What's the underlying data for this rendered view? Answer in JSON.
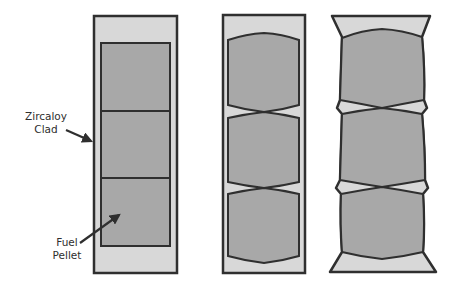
{
  "labels": {
    "clad": {
      "line1": "Zircaloy",
      "line2": "Clad"
    },
    "fuel": {
      "line1": "Fuel",
      "line2": "Pellet"
    }
  },
  "colors": {
    "background": "#ffffff",
    "clad_gap": "#d8d8d8",
    "pellet": "#a8a8a8",
    "outline": "#2f2f2f"
  },
  "panels": [
    {
      "id": "initial",
      "pellet_count": 3
    },
    {
      "id": "pellet-hourglassing",
      "pellet_count": 3
    },
    {
      "id": "clad-ridging",
      "pellet_count": 3
    }
  ]
}
